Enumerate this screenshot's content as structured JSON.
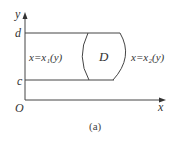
{
  "figure": {
    "caption": "(a)",
    "axes": {
      "x_label": "x",
      "y_label": "y",
      "origin_label": "O"
    },
    "y_ticks": {
      "upper": "d",
      "lower": "c"
    },
    "region_label": "D",
    "left_boundary": "x=x₁(y)",
    "right_boundary": "x=x₂(y)",
    "colors": {
      "stroke": "#444444",
      "text": "#333333",
      "background": "#ffffff"
    }
  }
}
